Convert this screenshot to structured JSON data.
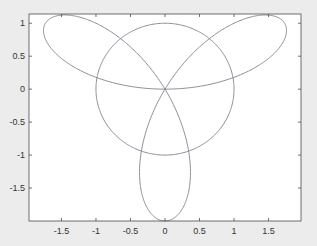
{
  "chart_data": {
    "type": "line",
    "title": "",
    "xlabel": "",
    "ylabel": "",
    "xlim": [
      -1.97,
      1.97
    ],
    "ylim": [
      -2,
      1.14
    ],
    "grid": false,
    "legend": null,
    "xticks": [
      -1.5,
      -1,
      -0.5,
      0,
      0.5,
      1,
      1.5
    ],
    "xtick_labels": [
      "-1.5",
      "-1",
      "-0.5",
      "0",
      "0.5",
      "1",
      "1.5"
    ],
    "yticks": [
      -1.5,
      -1,
      -0.5,
      0,
      0.5,
      1
    ],
    "ytick_labels": [
      "-1.5",
      "-1",
      "-0.5",
      "0",
      "0.5",
      "1"
    ],
    "series": [
      {
        "name": "three-petal rose r = 2 sin(3θ)",
        "equation": "x = 2 sin(3t) cos(t), y = 2 sin(3t) sin(t), t in [0, π]",
        "color": "#7f7f8c"
      },
      {
        "name": "unit circle",
        "equation": "x = cos(t), y = sin(t)",
        "color": "#7f7f8c"
      }
    ],
    "key_points": [
      {
        "label": "bottom petal tip",
        "x": 0,
        "y": -2
      },
      {
        "label": "upper-right petal tip",
        "x": 1.73,
        "y": 1.0
      },
      {
        "label": "upper-left petal tip",
        "x": -1.73,
        "y": 1.0
      },
      {
        "label": "origin crossing",
        "x": 0,
        "y": 0
      }
    ]
  },
  "colors": {
    "figure_bg": "#ececec",
    "axes_bg": "#ffffff",
    "axis": "#4d4d4d",
    "line": "#7f7f8c"
  }
}
